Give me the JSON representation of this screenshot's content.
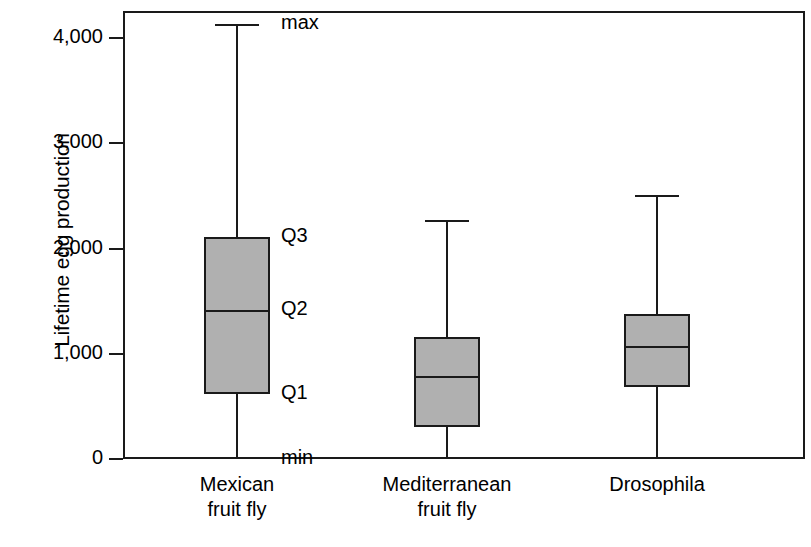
{
  "chart_data": {
    "type": "box",
    "title": "",
    "xlabel": "",
    "ylabel": "Lifetime egg production",
    "ylim": [
      0,
      4250
    ],
    "yticks": [
      0,
      1000,
      2000,
      3000,
      4000
    ],
    "ytick_labels": [
      "0",
      "1,000",
      "2,000",
      "3,000",
      "4,000"
    ],
    "grid": false,
    "legend": "none",
    "categories": [
      "Mexican fruit fly",
      "Mediterranean fruit fly",
      "Drosophila"
    ],
    "category_lines": [
      [
        "Mexican",
        "fruit fly"
      ],
      [
        "Mediterranean",
        "fruit fly"
      ],
      [
        "Drosophila",
        ""
      ]
    ],
    "boxes": [
      {
        "name": "Mexican fruit fly",
        "min": 0,
        "q1": 618,
        "median": 1416,
        "q3": 2109,
        "max": 4133
      },
      {
        "name": "Mediterranean fruit fly",
        "min": 0,
        "q1": 304,
        "median": 789,
        "q3": 1159,
        "max": 2271
      },
      {
        "name": "Drosophila",
        "min": 0,
        "q1": 684,
        "median": 1074,
        "q3": 1378,
        "max": 2508
      }
    ],
    "annotations": [
      {
        "label": "max",
        "value": 4133
      },
      {
        "label": "Q3",
        "value": 2109
      },
      {
        "label": "Q2",
        "value": 1416
      },
      {
        "label": "Q1",
        "value": 618
      },
      {
        "label": "min",
        "value": 0
      }
    ],
    "colors": {
      "box_fill": "#b0b0b0",
      "line": "#1a1a1a",
      "background": "#ffffff"
    }
  }
}
